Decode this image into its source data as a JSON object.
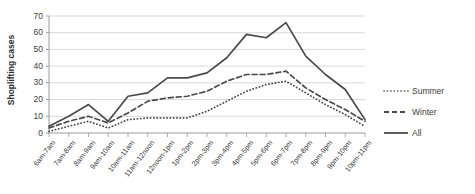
{
  "chart_data": {
    "type": "line",
    "title": "",
    "xlabel": "",
    "ylabel": "Shoplifting cases",
    "ylim": [
      0,
      70
    ],
    "yticks": [
      0,
      10,
      20,
      30,
      40,
      50,
      60,
      70
    ],
    "grid": true,
    "legend_position": "right",
    "categories": [
      "6am-7am",
      "7am-8am",
      "8am-9am",
      "9am-10am",
      "10am-11am",
      "11am-12noon",
      "12noon-1pm",
      "1pm-2pm",
      "2pm-3pm",
      "3pm-4pm",
      "4pm-5pm",
      "5pm-6pm",
      "6pm-7pm",
      "7pm-8pm",
      "8pm-9pm",
      "9pm-10pm",
      "10pm-11pm"
    ],
    "series": [
      {
        "name": "Summer",
        "style": "dotted",
        "color": "#4a4a4a",
        "values": [
          1,
          4,
          7,
          3,
          8,
          9,
          9,
          9,
          13,
          19,
          25,
          29,
          31,
          24,
          17,
          11,
          4
        ]
      },
      {
        "name": "Winter",
        "style": "dashed",
        "color": "#4a4a4a",
        "values": [
          3,
          7,
          10,
          6,
          12,
          19,
          21,
          22,
          25,
          31,
          35,
          35,
          37,
          27,
          20,
          14,
          7
        ]
      },
      {
        "name": "All",
        "style": "solid",
        "color": "#4a4a4a",
        "values": [
          4,
          10,
          17,
          7,
          22,
          24,
          33,
          33,
          36,
          45,
          59,
          57,
          66,
          46,
          35,
          26,
          8
        ]
      }
    ]
  },
  "legend": {
    "items": [
      {
        "label": "Summer"
      },
      {
        "label": "Winter"
      },
      {
        "label": "All"
      }
    ]
  },
  "axis": {
    "y_title": "Shoplifting cases",
    "y_labels": [
      "70",
      "60",
      "50",
      "40",
      "30",
      "20",
      "10",
      "0"
    ]
  }
}
